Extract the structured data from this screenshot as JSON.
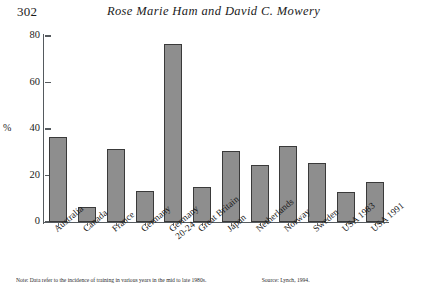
{
  "page": {
    "folio": "302",
    "running_title": "Rose Marie Ham and David C. Mowery"
  },
  "notes": {
    "note": "Note: Data refer to the incidence of training in various years in the mid to late 1980s.",
    "source": "Source: Lynch, 1994."
  },
  "chart_data": {
    "type": "bar",
    "title": "",
    "xlabel": "",
    "ylabel": "%",
    "ylim": [
      0,
      80
    ],
    "yticks": [
      0,
      20,
      40,
      60,
      80
    ],
    "ytick_labels": [
      "0",
      "20",
      "40",
      "60",
      "80"
    ],
    "grid": false,
    "legend": "none",
    "bar_color": "#8e8e8e",
    "bar_edge_color": "#3a3a3a",
    "categories": [
      "Australia",
      "Canada",
      "France",
      "Germany",
      "Germany 20-24",
      "Great Britain",
      "Japan",
      "Netherlands",
      "Norway",
      "Sweden",
      "USA 1983",
      "USA 1991"
    ],
    "category_lines": [
      [
        "Australia"
      ],
      [
        "Canada"
      ],
      [
        "France"
      ],
      [
        "Germany"
      ],
      [
        "Germany",
        "20-24"
      ],
      [
        "Great Britain"
      ],
      [
        "Japan"
      ],
      [
        "Netherlands"
      ],
      [
        "Norway"
      ],
      [
        "Sweden"
      ],
      [
        "USA 1983"
      ],
      [
        "USA 1991"
      ]
    ],
    "values": [
      36.5,
      6.5,
      31.5,
      13.5,
      76.5,
      15.0,
      30.5,
      24.5,
      32.5,
      25.5,
      13.0,
      17.0
    ]
  }
}
